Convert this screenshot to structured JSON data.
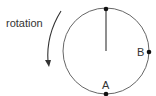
{
  "diagram": {
    "rotation_label": "rotation",
    "point_a_label": "A",
    "point_b_label": "B",
    "colors": {
      "stroke": "#555555",
      "dot": "#111111",
      "text": "#333333"
    }
  }
}
